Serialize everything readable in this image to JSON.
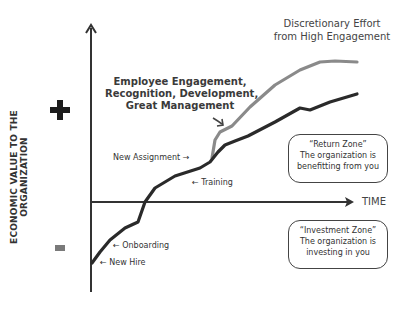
{
  "chart_data": {
    "type": "line",
    "title": "Discretionary Effort from High Engagement",
    "xlabel": "TIME",
    "ylabel": "ECONOMIC VALUE TO THE ORGANIZATION",
    "y_positive_marker": "+",
    "y_negative_marker": "-",
    "grid": false,
    "series": [
      {
        "name": "Baseline employee value",
        "color": "#2a2a2a",
        "points": [
          [
            92,
            263
          ],
          [
            100,
            252
          ],
          [
            110,
            240
          ],
          [
            125,
            228
          ],
          [
            138,
            222
          ],
          [
            145,
            202
          ],
          [
            155,
            188
          ],
          [
            175,
            176
          ],
          [
            200,
            168
          ],
          [
            210,
            162
          ],
          [
            218,
            152
          ],
          [
            225,
            145
          ],
          [
            235,
            141
          ],
          [
            248,
            136
          ],
          [
            275,
            122
          ],
          [
            300,
            108
          ],
          [
            310,
            110
          ],
          [
            330,
            102
          ],
          [
            357,
            94
          ]
        ]
      },
      {
        "name": "High engagement value",
        "color": "#8a8a8a",
        "points": [
          [
            212,
            158
          ],
          [
            215,
            140
          ],
          [
            220,
            132
          ],
          [
            232,
            126
          ],
          [
            250,
            107
          ],
          [
            275,
            85
          ],
          [
            300,
            70
          ],
          [
            320,
            62
          ],
          [
            335,
            61
          ],
          [
            357,
            62
          ]
        ]
      }
    ],
    "annotations": [
      "New Hire",
      "Onboarding",
      "Training",
      "New Assignment",
      "Employee Engagement, Recognition, Development, Great Management",
      "Discretionary Effort from High Engagement"
    ]
  },
  "labels": {
    "title_line1": "Discretionary Effort",
    "title_line2": "from High Engagement",
    "engagement_line1": "Employee Engagement,",
    "engagement_line2": "Recognition, Development,",
    "engagement_line3": "Great Management",
    "new_assignment": "New Assignment →",
    "training": "← Training",
    "onboarding": "← Onboarding",
    "new_hire": "← New Hire",
    "time": "TIME",
    "y_axis": "ECONOMIC VALUE TO THE ORGANIZATION"
  },
  "zones": {
    "return": {
      "line1": "“Return Zone”",
      "line2": "The organization is",
      "line3": "benefitting from you"
    },
    "investment": {
      "line1": "“Investment Zone”",
      "line2": "The organization is",
      "line3": "investing in you"
    }
  }
}
